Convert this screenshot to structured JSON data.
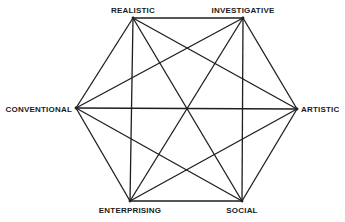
{
  "title": "",
  "vertices": [
    {
      "id": "R",
      "label": "REALISTIC"
    },
    {
      "id": "I",
      "label": "INVESTIGATIVE"
    },
    {
      "id": "A",
      "label": "ARTISTIC"
    },
    {
      "id": "S",
      "label": "SOCIAL"
    },
    {
      "id": "E",
      "label": "ENTERPRISING"
    },
    {
      "id": "C",
      "label": "CONVENTIONAL"
    }
  ],
  "edges": [
    [
      "R",
      "I"
    ],
    [
      "I",
      "A"
    ],
    [
      "A",
      "S"
    ],
    [
      "S",
      "E"
    ],
    [
      "E",
      "C"
    ],
    [
      "C",
      "R"
    ],
    [
      "R",
      "A"
    ],
    [
      "R",
      "S"
    ],
    [
      "R",
      "E"
    ],
    [
      "I",
      "S"
    ],
    [
      "I",
      "E"
    ],
    [
      "I",
      "C"
    ],
    [
      "A",
      "E"
    ],
    [
      "A",
      "C"
    ],
    [
      "S",
      "C"
    ]
  ],
  "colors": {
    "line": "#1e1e1e",
    "text": "#1a1a1a",
    "background": "#ffffff"
  }
}
